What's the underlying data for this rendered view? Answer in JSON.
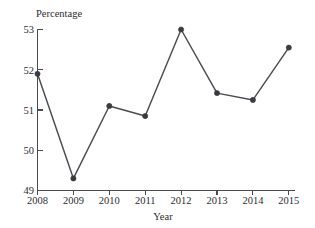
{
  "chart_data": {
    "type": "line",
    "title": "",
    "xlabel": "Year",
    "ylabel": "Percentage",
    "categories": [
      "2008",
      "2009",
      "2010",
      "2011",
      "2012",
      "2013",
      "2014",
      "2015"
    ],
    "x": [
      2008,
      2009,
      2010,
      2011,
      2012,
      2013,
      2014,
      2015
    ],
    "values": [
      51.9,
      49.3,
      51.1,
      50.85,
      53.0,
      51.42,
      51.25,
      52.55
    ],
    "series": [
      {
        "name": "Percentage",
        "values": [
          51.9,
          49.3,
          51.1,
          50.85,
          53.0,
          51.42,
          51.25,
          52.55
        ]
      }
    ],
    "ylim": [
      49,
      53
    ],
    "yticks": [
      49,
      50,
      51,
      52,
      53
    ],
    "yticklabels": [
      "49",
      "50",
      "51",
      "52",
      "53"
    ],
    "xticklabels": [
      "2008",
      "2009",
      "2010",
      "2011",
      "2012",
      "2013",
      "2014",
      "2015"
    ],
    "grid": false,
    "legend": false,
    "legend_position": "none",
    "marker": "circle",
    "line_color": "#4b4b52",
    "marker_color": "#3a3a40",
    "axis_color": "#4a4a4f",
    "background_color": "#ffffff"
  },
  "axes": {
    "y_title": "Percentage",
    "x_title": "Year"
  },
  "y_ticks": [
    {
      "label": "53"
    },
    {
      "label": "52"
    },
    {
      "label": "51"
    },
    {
      "label": "50"
    },
    {
      "label": "49"
    }
  ],
  "x_ticks": [
    {
      "label": "2008"
    },
    {
      "label": "2009"
    },
    {
      "label": "2010"
    },
    {
      "label": "2011"
    },
    {
      "label": "2012"
    },
    {
      "label": "2013"
    },
    {
      "label": "2014"
    },
    {
      "label": "2015"
    }
  ]
}
